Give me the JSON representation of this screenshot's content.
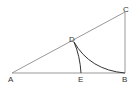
{
  "diagram": {
    "type": "geometry",
    "points": {
      "A": {
        "label": "A",
        "x": 12,
        "y": 73
      },
      "B": {
        "label": "B",
        "x": 125,
        "y": 73
      },
      "C": {
        "label": "C",
        "x": 125,
        "y": 12
      },
      "D": {
        "label": "D",
        "x": 74,
        "y": 42
      },
      "E": {
        "label": "E",
        "x": 81,
        "y": 73
      }
    },
    "segments": [
      "AB",
      "BC",
      "AC"
    ],
    "arcs": [
      "DE (centered at A)",
      "DB (centered at C)"
    ],
    "colors": {
      "line": "#888888",
      "arc": "#333333",
      "text": "#333333"
    }
  }
}
